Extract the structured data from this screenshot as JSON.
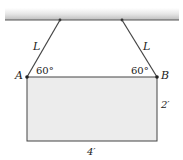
{
  "diagram": {
    "type": "statics-hanging-plate",
    "ceiling": {
      "label": ""
    },
    "cables": [
      {
        "id": "left",
        "label": "L"
      },
      {
        "id": "right",
        "label": "L"
      }
    ],
    "points": {
      "A": "A",
      "B": "B"
    },
    "angles": {
      "at_A": "60°",
      "at_B": "60°"
    },
    "dimensions": {
      "height": "2′",
      "width": "4′"
    },
    "colors": {
      "plate_fill": "#ececec",
      "line": "#333333",
      "ceiling_top": "#f2f2f2",
      "ceiling_bottom": "#c8c8c8"
    }
  }
}
